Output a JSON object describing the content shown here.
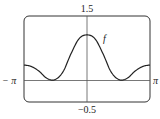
{
  "chart_data": {
    "type": "line",
    "title": "",
    "xlabel": "",
    "ylabel": "",
    "series": [
      {
        "name": "f",
        "x": [
          -3.1416,
          -2.8,
          -2.4,
          -2.0,
          -1.6,
          -1.2,
          -0.8,
          -0.4,
          0.0,
          0.4,
          0.8,
          1.2,
          1.6,
          2.0,
          2.4,
          2.8,
          3.1416
        ],
        "y": [
          0.36,
          0.33,
          0.22,
          0.05,
          0.02,
          0.2,
          0.62,
          0.97,
          1.06,
          0.97,
          0.62,
          0.2,
          0.02,
          0.05,
          0.22,
          0.33,
          0.36
        ]
      }
    ],
    "xlim": [
      -3.1416,
      3.1416
    ],
    "ylim": [
      -0.5,
      1.5
    ],
    "x_tick_labels": [
      "-π",
      "π"
    ],
    "y_tick_labels": [
      "1.5",
      "-0.5"
    ],
    "annotations": [
      "f"
    ],
    "grid": false,
    "legend": "none"
  },
  "labels": {
    "ymax": "1.5",
    "ymin": "−0.5",
    "xmin": "− π",
    "xmax": "π",
    "curve": "f"
  }
}
